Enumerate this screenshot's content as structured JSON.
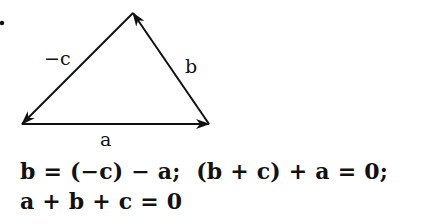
{
  "diagram": {
    "type": "vector-triangle",
    "bullet": "•",
    "vertices": {
      "top": [
        133,
        13
      ],
      "bottom_left": [
        22,
        124
      ],
      "bottom_right": [
        209,
        124
      ]
    },
    "vectors": [
      {
        "name": "a",
        "label": "a",
        "from": "bottom_left",
        "to": "bottom_right"
      },
      {
        "name": "b",
        "label": "b",
        "from": "bottom_right",
        "to": "top"
      },
      {
        "name": "-c",
        "label": "−c",
        "from": "top",
        "to": "bottom_left"
      }
    ],
    "stroke_color": "#111111"
  },
  "equations": {
    "line1": "b = (−c) − a;  (b + c) + a = 0;",
    "line2": "a + b + c = 0"
  }
}
